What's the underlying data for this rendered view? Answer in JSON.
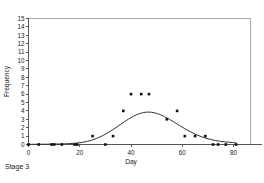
{
  "caption": "Stage 3",
  "chart_data": {
    "type": "scatter",
    "title": "",
    "xlabel": "Day",
    "ylabel": "Frequency",
    "xlim": [
      0,
      90
    ],
    "ylim": [
      0,
      15
    ],
    "xticks": [
      0,
      20,
      40,
      60,
      80
    ],
    "yticks": [
      0,
      1,
      2,
      3,
      4,
      5,
      6,
      7,
      8,
      9,
      10,
      11,
      12,
      13,
      14,
      15
    ],
    "grid": false,
    "legend": null,
    "series": [
      {
        "name": "Observed frequency",
        "type": "scatter",
        "marker": "square",
        "color": "#111111",
        "points": [
          [
            0,
            0
          ],
          [
            4,
            0
          ],
          [
            9,
            0
          ],
          [
            10,
            0
          ],
          [
            13,
            0
          ],
          [
            18,
            0
          ],
          [
            19,
            0
          ],
          [
            25,
            1
          ],
          [
            30,
            0
          ],
          [
            33,
            1
          ],
          [
            37,
            4
          ],
          [
            40,
            6
          ],
          [
            44,
            6
          ],
          [
            47,
            6
          ],
          [
            54,
            3
          ],
          [
            58,
            4
          ],
          [
            61,
            1
          ],
          [
            65,
            1
          ],
          [
            69,
            1
          ],
          [
            72,
            0
          ],
          [
            74,
            0
          ],
          [
            77,
            0
          ],
          [
            81,
            0
          ]
        ]
      },
      {
        "name": "Fitted curve",
        "type": "line",
        "color": "#333333",
        "points": [
          [
            0,
            0.02
          ],
          [
            5,
            0.03
          ],
          [
            10,
            0.05
          ],
          [
            14,
            0.08
          ],
          [
            17,
            0.13
          ],
          [
            19,
            0.18
          ],
          [
            21,
            0.26
          ],
          [
            23,
            0.38
          ],
          [
            25,
            0.55
          ],
          [
            27,
            0.78
          ],
          [
            29,
            1.06
          ],
          [
            31,
            1.4
          ],
          [
            33,
            1.78
          ],
          [
            35,
            2.2
          ],
          [
            37,
            2.62
          ],
          [
            39,
            3.02
          ],
          [
            41,
            3.37
          ],
          [
            43,
            3.64
          ],
          [
            45,
            3.81
          ],
          [
            47,
            3.86
          ],
          [
            49,
            3.78
          ],
          [
            51,
            3.6
          ],
          [
            53,
            3.33
          ],
          [
            55,
            3.0
          ],
          [
            57,
            2.63
          ],
          [
            59,
            2.25
          ],
          [
            61,
            1.88
          ],
          [
            63,
            1.54
          ],
          [
            65,
            1.24
          ],
          [
            67,
            0.98
          ],
          [
            69,
            0.77
          ],
          [
            71,
            0.6
          ],
          [
            73,
            0.47
          ],
          [
            75,
            0.37
          ],
          [
            77,
            0.3
          ],
          [
            79,
            0.25
          ],
          [
            81,
            0.2
          ]
        ]
      }
    ]
  }
}
